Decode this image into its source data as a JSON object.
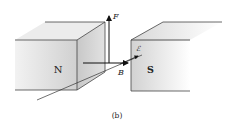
{
  "figure": {
    "caption": "(b)",
    "magnets": {
      "north": {
        "label": "N"
      },
      "south": {
        "label": "S"
      }
    },
    "vectors": {
      "force": {
        "label": "F"
      },
      "field": {
        "label": "B"
      },
      "emf": {
        "label": "ℰ"
      }
    },
    "colors": {
      "magnet_face": "#d9d9d9",
      "magnet_side": "#c4c4c4",
      "magnet_top": "#e6e6e6",
      "edge": "#444444",
      "arrow": "#111111"
    }
  }
}
